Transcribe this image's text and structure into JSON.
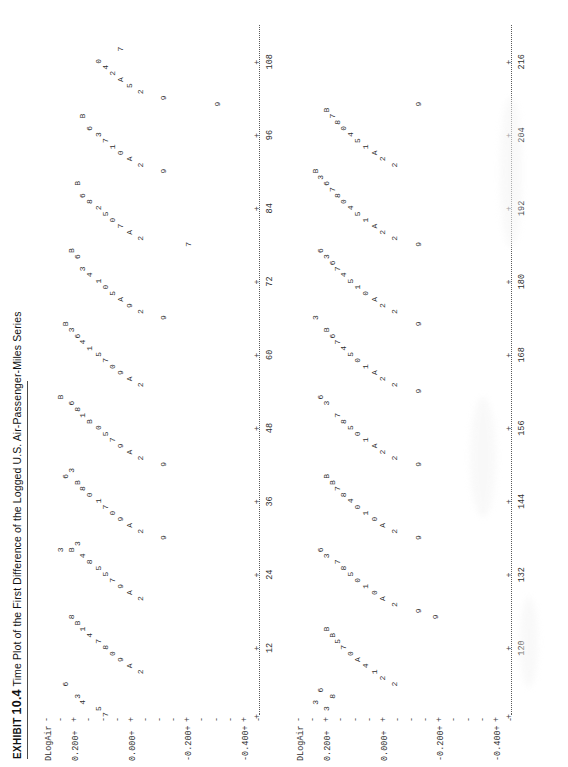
{
  "caption": {
    "exhibit_word": "EXHIBIT",
    "number": "10.4",
    "title": "Time Plot of the First Difference of the Logged U.S. Air-Passenger-Miles Series"
  },
  "chart_data": {
    "type": "scatter",
    "title": "Time Plot of the First Difference of the Logged U.S. Air-Passenger-Miles Series",
    "plot_style": "minitab-character-plot",
    "xlabel": "",
    "ylabel": "DLogAir",
    "ylim": [
      -0.45,
      0.3
    ],
    "grid": false,
    "legend_position": "none",
    "point_label_key": "Month of year plotted as character: 1=Jan ... 9=Sep, 0=Oct, A=Nov, B=Dec",
    "panels": [
      {
        "name": "panel-top",
        "ylabel": "DLogAir",
        "y_ticks": [
          "0.200+",
          "0.000+",
          "-0.200+",
          "-0.400+"
        ],
        "y_tick_values": [
          0.2,
          0.0,
          -0.2,
          -0.4
        ],
        "x_ticks": [
          "12",
          "24",
          "36",
          "48",
          "60",
          "72",
          "84",
          "96",
          "108"
        ],
        "x_tick_values": [
          12,
          24,
          36,
          48,
          60,
          72,
          84,
          96,
          108
        ],
        "xlim": [
          1,
          114
        ],
        "rows": [
          {
            "y": 0.255,
            "cells": [
              [
                28,
                "3"
              ],
              [
                53,
                "B"
              ]
            ]
          },
          {
            "y": 0.235,
            "cells": [
              [
                6,
                "6"
              ],
              [
                40,
                "6"
              ],
              [
                65,
                "B"
              ]
            ]
          },
          {
            "y": 0.215,
            "cells": [
              [
                17,
                "8"
              ],
              [
                28,
                "B"
              ],
              [
                41,
                "3"
              ],
              [
                52,
                "6"
              ],
              [
                64,
                "3"
              ],
              [
                77,
                "B"
              ]
            ]
          },
          {
            "y": 0.195,
            "cells": [
              [
                4,
                "3"
              ],
              [
                16,
                "B"
              ],
              [
                29,
                "3"
              ],
              [
                39,
                "B"
              ],
              [
                51,
                "8"
              ],
              [
                63,
                "6"
              ],
              [
                76,
                "6"
              ],
              [
                88,
                "B"
              ]
            ]
          },
          {
            "y": 0.175,
            "cells": [
              [
                3,
                "4"
              ],
              [
                15,
                "1"
              ],
              [
                27,
                "4"
              ],
              [
                38,
                "8"
              ],
              [
                50,
                "1"
              ],
              [
                62,
                "4"
              ],
              [
                74,
                "3"
              ],
              [
                86,
                "6"
              ],
              [
                99,
                "B"
              ]
            ]
          },
          {
            "y": 0.15,
            "cells": [
              [
                14,
                "4"
              ],
              [
                26,
                "8"
              ],
              [
                37,
                "0"
              ],
              [
                49,
                "B"
              ],
              [
                61,
                "1"
              ],
              [
                73,
                "4"
              ],
              [
                85,
                "8"
              ],
              [
                97,
                "6"
              ]
            ]
          },
          {
            "y": 0.12,
            "cells": [
              [
                2,
                "5"
              ],
              [
                13,
                "7"
              ],
              [
                25,
                "5"
              ],
              [
                36,
                "1"
              ],
              [
                48,
                "0"
              ],
              [
                60,
                "5"
              ],
              [
                72,
                "1"
              ],
              [
                84,
                "2"
              ],
              [
                96,
                "3"
              ],
              [
                108,
                "0"
              ]
            ]
          },
          {
            "y": 0.095,
            "cells": [
              [
                1,
                "7"
              ],
              [
                12,
                "8"
              ],
              [
                24,
                "5"
              ],
              [
                35,
                "7"
              ],
              [
                47,
                "5"
              ],
              [
                59,
                "7"
              ],
              [
                71,
                "0"
              ],
              [
                83,
                "5"
              ],
              [
                95,
                "7"
              ],
              [
                107,
                "4"
              ]
            ]
          },
          {
            "y": 0.07,
            "cells": [
              [
                11,
                "0"
              ],
              [
                23,
                "7"
              ],
              [
                34,
                "0"
              ],
              [
                46,
                "7"
              ],
              [
                58,
                "0"
              ],
              [
                70,
                "5"
              ],
              [
                82,
                "0"
              ],
              [
                94,
                "1"
              ],
              [
                106,
                "2"
              ]
            ]
          },
          {
            "y": 0.04,
            "cells": [
              [
                10,
                "9"
              ],
              [
                22,
                "9"
              ],
              [
                33,
                "9"
              ],
              [
                45,
                "9"
              ],
              [
                57,
                "9"
              ],
              [
                69,
                "A"
              ],
              [
                81,
                "7"
              ],
              [
                93,
                "0"
              ],
              [
                105,
                "A"
              ],
              [
                110,
                "7"
              ]
            ]
          },
          {
            "y": 0.01,
            "cells": [
              [
                9,
                "A"
              ],
              [
                21,
                "A"
              ],
              [
                32,
                "A"
              ],
              [
                44,
                "A"
              ],
              [
                56,
                "A"
              ],
              [
                68,
                "9"
              ],
              [
                80,
                "A"
              ],
              [
                92,
                "A"
              ],
              [
                104,
                "5"
              ]
            ]
          },
          {
            "y": -0.03,
            "cells": [
              [
                8,
                "2"
              ],
              [
                20,
                "2"
              ],
              [
                31,
                "2"
              ],
              [
                43,
                "2"
              ],
              [
                55,
                "2"
              ],
              [
                67,
                "2"
              ],
              [
                79,
                "2"
              ],
              [
                91,
                "2"
              ],
              [
                103,
                "2"
              ]
            ]
          },
          {
            "y": -0.11,
            "cells": [
              [
                30,
                "9"
              ],
              [
                42,
                "9"
              ],
              [
                66,
                "9"
              ],
              [
                90,
                "9"
              ],
              [
                102,
                "9"
              ]
            ]
          },
          {
            "y": -0.2,
            "cells": [
              [
                78,
                "7"
              ]
            ]
          },
          {
            "y": -0.3,
            "cells": [
              [
                101,
                "9"
              ]
            ]
          }
        ]
      },
      {
        "name": "panel-bottom",
        "ylabel": "DLogAir",
        "y_ticks": [
          "0.200+",
          "0.000+",
          "-0.200+",
          "-0.400+"
        ],
        "y_tick_values": [
          0.2,
          0.0,
          -0.2,
          -0.4
        ],
        "x_ticks": [
          "120",
          "132",
          "144",
          "156",
          "168",
          "180",
          "192",
          "204",
          "216"
        ],
        "x_tick_values": [
          120,
          132,
          144,
          156,
          168,
          180,
          192,
          204,
          216
        ],
        "xlim": [
          109,
          222
        ],
        "rows": [
          {
            "y": 0.245,
            "cells": [
              [
                2,
                "3"
              ],
              [
                65,
                "3"
              ],
              [
                89,
                "B"
              ]
            ]
          },
          {
            "y": 0.225,
            "cells": [
              [
                4,
                "6"
              ],
              [
                27,
                "6"
              ],
              [
                52,
                "6"
              ],
              [
                76,
                "6"
              ],
              [
                88,
                "3"
              ]
            ]
          },
          {
            "y": 0.205,
            "cells": [
              [
                1,
                "3"
              ],
              [
                14,
                "B"
              ],
              [
                26,
                "3"
              ],
              [
                39,
                "B"
              ],
              [
                51,
                "3"
              ],
              [
                63,
                "B"
              ],
              [
                75,
                "3"
              ],
              [
                87,
                "6"
              ],
              [
                99,
                "B"
              ]
            ]
          },
          {
            "y": 0.185,
            "cells": [
              [
                3,
                "8"
              ],
              [
                13,
                "B"
              ],
              [
                38,
                "B"
              ],
              [
                62,
                "6"
              ],
              [
                74,
                "6"
              ],
              [
                86,
                "7"
              ],
              [
                98,
                "7"
              ]
            ]
          },
          {
            "y": 0.165,
            "cells": [
              [
                12,
                "5"
              ],
              [
                25,
                "7"
              ],
              [
                37,
                "7"
              ],
              [
                49,
                "7"
              ],
              [
                61,
                "7"
              ],
              [
                73,
                "7"
              ],
              [
                85,
                "8"
              ],
              [
                97,
                "8"
              ]
            ]
          },
          {
            "y": 0.145,
            "cells": [
              [
                11,
                "7"
              ],
              [
                24,
                "8"
              ],
              [
                36,
                "8"
              ],
              [
                48,
                "8"
              ],
              [
                60,
                "4"
              ],
              [
                72,
                "4"
              ],
              [
                84,
                "0"
              ],
              [
                96,
                "0"
              ]
            ]
          },
          {
            "y": 0.12,
            "cells": [
              [
                10,
                "0"
              ],
              [
                23,
                "5"
              ],
              [
                35,
                "4"
              ],
              [
                47,
                "5"
              ],
              [
                59,
                "5"
              ],
              [
                71,
                "5"
              ],
              [
                83,
                "4"
              ],
              [
                95,
                "4"
              ]
            ]
          },
          {
            "y": 0.095,
            "cells": [
              [
                9,
                "A"
              ],
              [
                22,
                "0"
              ],
              [
                34,
                "0"
              ],
              [
                46,
                "0"
              ],
              [
                58,
                "0"
              ],
              [
                70,
                "1"
              ],
              [
                82,
                "5"
              ],
              [
                94,
                "5"
              ]
            ]
          },
          {
            "y": 0.065,
            "cells": [
              [
                8,
                "4"
              ],
              [
                21,
                "1"
              ],
              [
                33,
                "1"
              ],
              [
                45,
                "1"
              ],
              [
                57,
                "1"
              ],
              [
                69,
                "0"
              ],
              [
                81,
                "1"
              ],
              [
                93,
                "1"
              ]
            ]
          },
          {
            "y": 0.035,
            "cells": [
              [
                7,
                "1"
              ],
              [
                20,
                "0"
              ],
              [
                32,
                "0"
              ],
              [
                44,
                "A"
              ],
              [
                56,
                "A"
              ],
              [
                68,
                "A"
              ],
              [
                80,
                "A"
              ],
              [
                92,
                "A"
              ]
            ]
          },
          {
            "y": 0.005,
            "cells": [
              [
                6,
                "2"
              ],
              [
                19,
                "A"
              ],
              [
                31,
                "A"
              ],
              [
                43,
                "2"
              ],
              [
                55,
                "2"
              ],
              [
                67,
                "2"
              ],
              [
                79,
                "2"
              ],
              [
                91,
                "2"
              ]
            ]
          },
          {
            "y": -0.035,
            "cells": [
              [
                5,
                "2"
              ],
              [
                18,
                "2"
              ],
              [
                30,
                "2"
              ],
              [
                42,
                "2"
              ],
              [
                54,
                "2"
              ],
              [
                66,
                "2"
              ],
              [
                78,
                "2"
              ],
              [
                90,
                "2"
              ]
            ]
          },
          {
            "y": -0.12,
            "cells": [
              [
                17,
                "9"
              ],
              [
                29,
                "9"
              ],
              [
                41,
                "9"
              ],
              [
                53,
                "9"
              ],
              [
                64,
                "9"
              ],
              [
                77,
                "9"
              ],
              [
                100,
                "9"
              ]
            ]
          },
          {
            "y": -0.18,
            "cells": [
              [
                16,
                "9"
              ]
            ]
          }
        ]
      }
    ]
  }
}
